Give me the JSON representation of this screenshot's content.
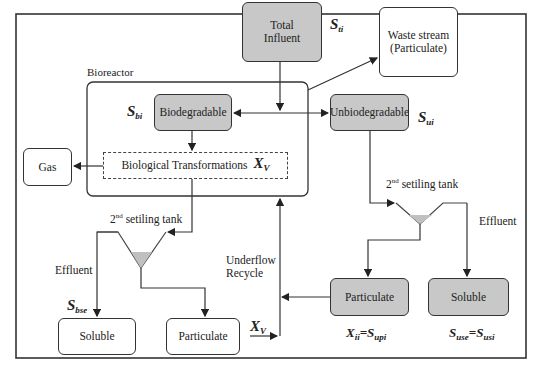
{
  "diagram": {
    "total_influent": {
      "label": "Total Influent",
      "symbol": "S",
      "sub": "ti"
    },
    "waste_stream": {
      "line1": "Waste stream",
      "line2": "(Particulate)"
    },
    "bioreactor": {
      "label": "Bioreactor"
    },
    "biodegradable": {
      "label": "Biodegradable",
      "symbol": "S",
      "sub": "bi"
    },
    "unbiodegradable": {
      "label": "Unbiodegradable",
      "symbol": "S",
      "sub": "ui"
    },
    "transformations": {
      "label": "Biological Transformations",
      "symbol": "X",
      "sub": "V"
    },
    "gas": {
      "label": "Gas"
    },
    "left_tank": {
      "num": "2",
      "sup": "nd",
      "label": " setiling tank"
    },
    "left_effluent": {
      "label": "Effluent",
      "symbol": "S",
      "sub": "bse"
    },
    "left_soluble": {
      "label": "Soluble"
    },
    "left_particulate": {
      "label": "Particulate",
      "symbol": "X",
      "sub": "V"
    },
    "underflow": {
      "line1": "Underflow",
      "line2": "Recycle"
    },
    "right_tank": {
      "num": "2",
      "sup": "nd",
      "label": " setiling tank"
    },
    "right_effluent": {
      "label": "Effluent"
    },
    "right_particulate": {
      "label": "Particulate",
      "sym1": "X",
      "sub1": "ii",
      "eq": "=",
      "sym2": "S",
      "sub2": "upi"
    },
    "right_soluble": {
      "label": "Soluble",
      "sym1": "S",
      "sub1": "use",
      "eq": "=",
      "sym2": "S",
      "sub2": "usi"
    },
    "colors": {
      "gray_fill": "#c8c8c8",
      "stroke": "#333333",
      "tank_fill": "#c0c0c0"
    }
  }
}
